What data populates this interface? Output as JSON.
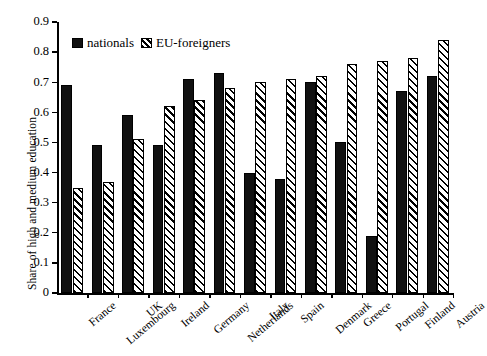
{
  "chart_data": {
    "type": "bar",
    "title": "",
    "xlabel": "",
    "ylabel": "Share of high and medium education",
    "ylim": [
      0,
      0.9
    ],
    "grid": false,
    "legend_position": "top-left-inside",
    "y_ticks": [
      "0",
      "0.1",
      "0.2",
      "0.3",
      "0.4",
      "0.5",
      "0.6",
      "0.7",
      "0.8",
      "0.9"
    ],
    "y_tick_values": [
      0,
      0.1,
      0.2,
      0.3,
      0.4,
      0.5,
      0.6,
      0.7,
      0.8,
      0.9
    ],
    "categories": [
      "France",
      "Luxembourg",
      "UK",
      "Ireland",
      "Germany",
      "Netherlands",
      "Italy",
      "Spain",
      "Denmark",
      "Greece",
      "Portugal",
      "Finland",
      "Austria"
    ],
    "series": [
      {
        "name": "nationals",
        "style": "solid-black",
        "values": [
          0.69,
          0.49,
          0.59,
          0.49,
          0.71,
          0.73,
          0.4,
          0.38,
          0.7,
          0.5,
          0.19,
          0.67,
          0.72
        ]
      },
      {
        "name": "EU-foreigners",
        "style": "diagonal-hatch",
        "values": [
          0.35,
          0.37,
          0.51,
          0.62,
          0.64,
          0.68,
          0.7,
          0.71,
          0.72,
          0.76,
          0.77,
          0.78,
          0.84
        ]
      }
    ],
    "legend": [
      {
        "label": "nationals",
        "swatch": "solid-black"
      },
      {
        "label": "EU-foreigners",
        "swatch": "diagonal-hatch"
      }
    ],
    "colors": {
      "nationals": "#111111",
      "eu_foreigners_fill": "#ffffff",
      "eu_foreigners_hatch": "#000000",
      "axis": "#000000",
      "background": "#ffffff"
    }
  }
}
